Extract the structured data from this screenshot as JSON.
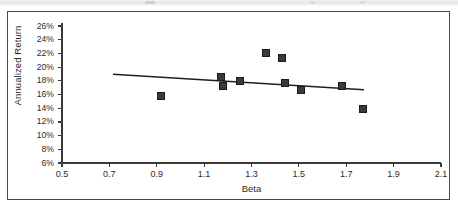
{
  "figure": {
    "x_axis_title": "Beta",
    "y_axis_title": "Annualized Return"
  },
  "chart_data": {
    "type": "scatter",
    "title": "",
    "xlabel": "Beta",
    "ylabel": "Annualized Return",
    "xlim": [
      0.5,
      2.1
    ],
    "ylim": [
      6,
      26
    ],
    "xtick_step": 0.2,
    "ytick_step": 2,
    "grid": false,
    "legend": "none",
    "x_tick_labels": [
      "0.5",
      "0.7",
      "0.9",
      "1.1",
      "1.3",
      "1.5",
      "1.7",
      "1.9",
      "2.1"
    ],
    "x_tick_values": [
      0.5,
      0.7,
      0.9,
      1.1,
      1.3,
      1.5,
      1.7,
      1.9,
      2.1
    ],
    "y_tick_labels": [
      "26%",
      "24%",
      "22%",
      "20%",
      "18%",
      "16%",
      "14%",
      "12%",
      "10%",
      "8%",
      "6%"
    ],
    "y_tick_values": [
      26,
      24,
      22,
      20,
      18,
      16,
      14,
      12,
      10,
      8,
      6
    ],
    "marker_color": "#3a3a3a",
    "marker_shape": "square",
    "points": [
      {
        "x": 0.92,
        "y": 15.8
      },
      {
        "x": 1.17,
        "y": 18.5
      },
      {
        "x": 1.18,
        "y": 17.3
      },
      {
        "x": 1.25,
        "y": 17.9
      },
      {
        "x": 1.36,
        "y": 22.1
      },
      {
        "x": 1.43,
        "y": 21.4
      },
      {
        "x": 1.44,
        "y": 17.7
      },
      {
        "x": 1.51,
        "y": 16.6
      },
      {
        "x": 1.68,
        "y": 17.2
      },
      {
        "x": 1.77,
        "y": 13.9
      }
    ],
    "trendline": {
      "x_start": 0.715,
      "y_start": 18.95,
      "x_end": 1.775,
      "y_end": 16.7,
      "color": "#1f1f1f"
    }
  }
}
